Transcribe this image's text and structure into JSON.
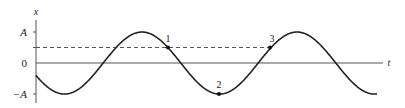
{
  "diagram": {
    "axes": {
      "vertical_label": "x",
      "horizontal_label": "t",
      "tick_labels": {
        "amplitude_positive": "A",
        "zero": "0",
        "amplitude_negative": "−A"
      }
    },
    "points": [
      {
        "label": "1",
        "x": 168,
        "y": 47
      },
      {
        "label": "2",
        "x": 219,
        "y": 94
      },
      {
        "label": "3",
        "x": 270,
        "y": 47
      }
    ],
    "dashed_level": "A/2",
    "colors": {
      "curve": "#222222",
      "axis": "#555555",
      "dashed": "#555555"
    }
  }
}
